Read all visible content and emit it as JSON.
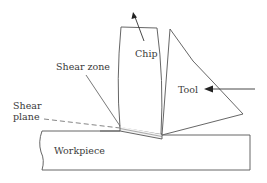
{
  "diagram": {
    "type": "orthogonal-cutting-schematic",
    "labels": {
      "chip": "Chip",
      "shear_zone": "Shear zone",
      "shear_plane_line1": "Shear",
      "shear_plane_line2": "plane",
      "tool": "Tool",
      "workpiece": "Workpiece"
    },
    "colors": {
      "stroke": "#4a4a4a",
      "text": "#3a3a3a",
      "background": "#ffffff"
    }
  }
}
